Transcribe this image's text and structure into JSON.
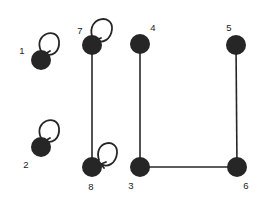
{
  "figure": {
    "type": "undirected-graph-diagram",
    "background_color": "#ffffff",
    "ink_color": "#262626",
    "label_color": "#1b1b1b",
    "width": 264,
    "height": 201,
    "node_radius": 10,
    "edge_width": 1.6,
    "loop_width": 1.8
  },
  "graph_data": {
    "node_count": 8,
    "edge_count": 4,
    "self_loop_count": 4,
    "nodes": [
      {
        "id": "1",
        "label": "1",
        "cx": 41,
        "cy": 60,
        "label_x": 22,
        "label_y": 51,
        "self_loop": true
      },
      {
        "id": "2",
        "label": "2",
        "cx": 41,
        "cy": 147,
        "label_x": 26,
        "label_y": 165,
        "self_loop": true
      },
      {
        "id": "3",
        "label": "3",
        "cx": 140,
        "cy": 167,
        "label_x": 131,
        "label_y": 186,
        "self_loop": false
      },
      {
        "id": "4",
        "label": "4",
        "cx": 140,
        "cy": 44,
        "label_x": 153,
        "label_y": 28,
        "self_loop": false
      },
      {
        "id": "5",
        "label": "5",
        "cx": 236,
        "cy": 45,
        "label_x": 229,
        "label_y": 28,
        "self_loop": false
      },
      {
        "id": "6",
        "label": "6",
        "cx": 237,
        "cy": 167,
        "label_x": 246,
        "label_y": 186,
        "self_loop": false
      },
      {
        "id": "7",
        "label": "7",
        "cx": 92,
        "cy": 45,
        "label_x": 80,
        "label_y": 31,
        "self_loop": true
      },
      {
        "id": "8",
        "label": "8",
        "cx": 92,
        "cy": 167,
        "label_x": 91,
        "label_y": 187,
        "self_loop": true
      }
    ],
    "edges": [
      {
        "source": "7",
        "target": "8",
        "x1": 92,
        "y1": 45,
        "x2": 92,
        "y2": 167
      },
      {
        "source": "4",
        "target": "3",
        "x1": 140,
        "y1": 44,
        "x2": 140,
        "y2": 167
      },
      {
        "source": "5",
        "target": "6",
        "x1": 236,
        "y1": 45,
        "x2": 237,
        "y2": 167
      },
      {
        "source": "3",
        "target": "6",
        "x1": 140,
        "y1": 167,
        "x2": 237,
        "y2": 167
      }
    ],
    "self_loops": [
      {
        "node": "1",
        "path": "M 41 51 C 33 34 57 26 59 41 C 60 52 52 57 45 54",
        "arrow": "M 45 54 L 50 51 M 45 54 L 48 58"
      },
      {
        "node": "2",
        "path": "M 41 138 C 33 121 57 113 59 128 C 60 139 52 144 45 141",
        "arrow": "M 45 141 L 50 138 M 45 141 L 48 145"
      },
      {
        "node": "7",
        "path": "M 92 36 C 87 17 113 13 112 29 C 111 40 102 44 96 40",
        "arrow": "M 96 40 L 101 38 M 96 40 L 99 44"
      },
      {
        "node": "8",
        "path": "M 99 160 C 93 141 118 137 117 153 C 116 164 107 168 101 164",
        "arrow": "M 101 164 L 106 162 M 101 164 L 104 168"
      }
    ]
  }
}
